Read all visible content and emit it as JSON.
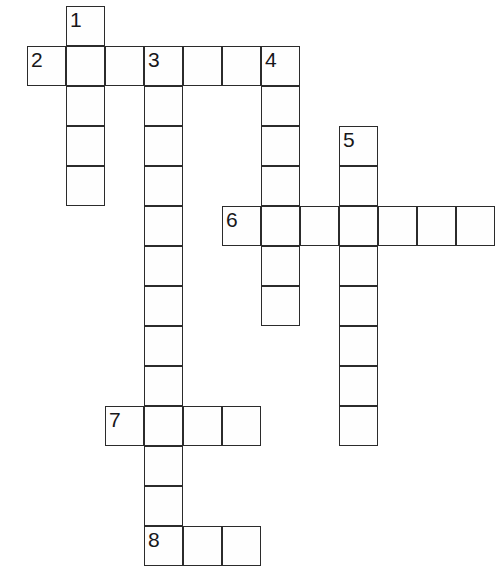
{
  "puzzle": {
    "title": "Crossword Grid",
    "cell_size": 39,
    "row_height": 40,
    "origin_x": 27,
    "origin_y": 6,
    "grid_color": "#2b2b2b",
    "cell_fill": "#fefefe",
    "background": "#ffffff",
    "number_color": "#17171a",
    "entries": [
      {
        "number": "1",
        "direction": "down",
        "length": 5,
        "start_col": 1,
        "start_row": 0,
        "cells": [
          {
            "x": 66,
            "y": 6,
            "number": "1"
          },
          {
            "x": 66,
            "y": 46,
            "number": ""
          },
          {
            "x": 66,
            "y": 86,
            "number": ""
          },
          {
            "x": 66,
            "y": 126,
            "number": ""
          },
          {
            "x": 66,
            "y": 166,
            "number": ""
          }
        ]
      },
      {
        "number": "2",
        "direction": "across",
        "length": 7,
        "start_col": 0,
        "start_row": 1,
        "cells": [
          {
            "x": 27,
            "y": 46,
            "number": "2"
          },
          {
            "x": 105,
            "y": 46,
            "number": ""
          },
          {
            "x": 144,
            "y": 46,
            "number": "3"
          },
          {
            "x": 183,
            "y": 46,
            "number": ""
          },
          {
            "x": 222,
            "y": 46,
            "number": ""
          },
          {
            "x": 261,
            "y": 46,
            "number": "4"
          }
        ]
      },
      {
        "number": "3",
        "direction": "down",
        "length": 13,
        "start_col": 3,
        "start_row": 1,
        "cells": [
          {
            "x": 144,
            "y": 86,
            "number": ""
          },
          {
            "x": 144,
            "y": 126,
            "number": ""
          },
          {
            "x": 144,
            "y": 166,
            "number": ""
          },
          {
            "x": 144,
            "y": 206,
            "number": ""
          },
          {
            "x": 144,
            "y": 246,
            "number": ""
          },
          {
            "x": 144,
            "y": 286,
            "number": ""
          },
          {
            "x": 144,
            "y": 326,
            "number": ""
          },
          {
            "x": 144,
            "y": 366,
            "number": ""
          },
          {
            "x": 144,
            "y": 406,
            "number": ""
          },
          {
            "x": 144,
            "y": 446,
            "number": ""
          },
          {
            "x": 144,
            "y": 486,
            "number": ""
          },
          {
            "x": 144,
            "y": 526,
            "number": "8"
          }
        ]
      },
      {
        "number": "4",
        "direction": "down",
        "length": 7,
        "start_col": 6,
        "start_row": 1,
        "cells": [
          {
            "x": 261,
            "y": 86,
            "number": ""
          },
          {
            "x": 261,
            "y": 126,
            "number": ""
          },
          {
            "x": 261,
            "y": 166,
            "number": ""
          },
          {
            "x": 261,
            "y": 206,
            "number": ""
          },
          {
            "x": 261,
            "y": 246,
            "number": ""
          },
          {
            "x": 261,
            "y": 286,
            "number": ""
          }
        ]
      },
      {
        "number": "5",
        "direction": "down",
        "length": 8,
        "start_col": 8,
        "start_row": 3,
        "cells": [
          {
            "x": 339,
            "y": 126,
            "number": "5"
          },
          {
            "x": 339,
            "y": 166,
            "number": ""
          },
          {
            "x": 339,
            "y": 206,
            "number": ""
          },
          {
            "x": 339,
            "y": 246,
            "number": ""
          },
          {
            "x": 339,
            "y": 286,
            "number": ""
          },
          {
            "x": 339,
            "y": 326,
            "number": ""
          },
          {
            "x": 339,
            "y": 366,
            "number": ""
          },
          {
            "x": 339,
            "y": 406,
            "number": ""
          }
        ]
      },
      {
        "number": "6",
        "direction": "across",
        "length": 7,
        "start_col": 5,
        "start_row": 5,
        "cells": [
          {
            "x": 222,
            "y": 206,
            "number": "6"
          },
          {
            "x": 300,
            "y": 206,
            "number": ""
          },
          {
            "x": 378,
            "y": 206,
            "number": ""
          },
          {
            "x": 417,
            "y": 206,
            "number": ""
          },
          {
            "x": 456,
            "y": 206,
            "number": ""
          }
        ]
      },
      {
        "number": "7",
        "direction": "across",
        "length": 4,
        "start_col": 2,
        "start_row": 10,
        "cells": [
          {
            "x": 105,
            "y": 406,
            "number": "7"
          },
          {
            "x": 183,
            "y": 406,
            "number": ""
          },
          {
            "x": 222,
            "y": 406,
            "number": ""
          }
        ]
      },
      {
        "number": "8",
        "direction": "across",
        "length": 3,
        "start_col": 3,
        "start_row": 13,
        "cells": [
          {
            "x": 183,
            "y": 526,
            "number": ""
          },
          {
            "x": 222,
            "y": 526,
            "number": ""
          }
        ]
      }
    ],
    "all_cells": [
      {
        "x": 66,
        "y": 6,
        "number": "1"
      },
      {
        "x": 27,
        "y": 46,
        "number": "2"
      },
      {
        "x": 66,
        "y": 46,
        "number": ""
      },
      {
        "x": 105,
        "y": 46,
        "number": ""
      },
      {
        "x": 144,
        "y": 46,
        "number": "3"
      },
      {
        "x": 183,
        "y": 46,
        "number": ""
      },
      {
        "x": 222,
        "y": 46,
        "number": ""
      },
      {
        "x": 261,
        "y": 46,
        "number": "4"
      },
      {
        "x": 66,
        "y": 86,
        "number": ""
      },
      {
        "x": 144,
        "y": 86,
        "number": ""
      },
      {
        "x": 261,
        "y": 86,
        "number": ""
      },
      {
        "x": 66,
        "y": 126,
        "number": ""
      },
      {
        "x": 144,
        "y": 126,
        "number": ""
      },
      {
        "x": 261,
        "y": 126,
        "number": ""
      },
      {
        "x": 339,
        "y": 126,
        "number": "5"
      },
      {
        "x": 66,
        "y": 166,
        "number": ""
      },
      {
        "x": 144,
        "y": 166,
        "number": ""
      },
      {
        "x": 261,
        "y": 166,
        "number": ""
      },
      {
        "x": 339,
        "y": 166,
        "number": ""
      },
      {
        "x": 144,
        "y": 206,
        "number": ""
      },
      {
        "x": 222,
        "y": 206,
        "number": "6"
      },
      {
        "x": 261,
        "y": 206,
        "number": ""
      },
      {
        "x": 300,
        "y": 206,
        "number": ""
      },
      {
        "x": 339,
        "y": 206,
        "number": ""
      },
      {
        "x": 378,
        "y": 206,
        "number": ""
      },
      {
        "x": 417,
        "y": 206,
        "number": ""
      },
      {
        "x": 456,
        "y": 206,
        "number": ""
      },
      {
        "x": 144,
        "y": 246,
        "number": ""
      },
      {
        "x": 261,
        "y": 246,
        "number": ""
      },
      {
        "x": 339,
        "y": 246,
        "number": ""
      },
      {
        "x": 144,
        "y": 286,
        "number": ""
      },
      {
        "x": 261,
        "y": 286,
        "number": ""
      },
      {
        "x": 339,
        "y": 286,
        "number": ""
      },
      {
        "x": 144,
        "y": 326,
        "number": ""
      },
      {
        "x": 339,
        "y": 326,
        "number": ""
      },
      {
        "x": 144,
        "y": 366,
        "number": ""
      },
      {
        "x": 339,
        "y": 366,
        "number": ""
      },
      {
        "x": 105,
        "y": 406,
        "number": "7"
      },
      {
        "x": 144,
        "y": 406,
        "number": ""
      },
      {
        "x": 183,
        "y": 406,
        "number": ""
      },
      {
        "x": 222,
        "y": 406,
        "number": ""
      },
      {
        "x": 339,
        "y": 406,
        "number": ""
      },
      {
        "x": 144,
        "y": 446,
        "number": ""
      },
      {
        "x": 144,
        "y": 486,
        "number": ""
      },
      {
        "x": 144,
        "y": 526,
        "number": "8"
      },
      {
        "x": 183,
        "y": 526,
        "number": ""
      },
      {
        "x": 222,
        "y": 526,
        "number": ""
      }
    ]
  }
}
